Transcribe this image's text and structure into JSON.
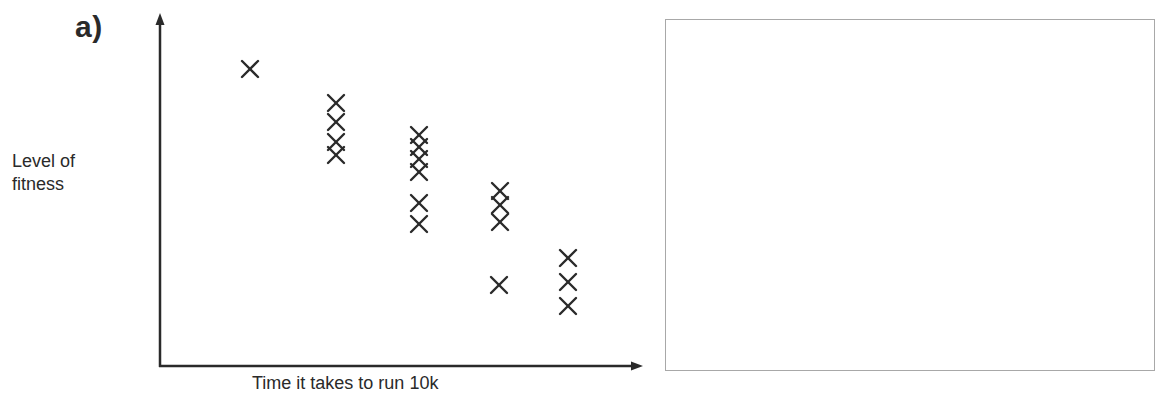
{
  "panel": {
    "label": "a)"
  },
  "chart_data": {
    "type": "scatter",
    "title": "",
    "xlabel": "Time it takes to run 10k",
    "ylabel": "Level of fitness",
    "ylabel_lines": [
      "Level of",
      "fitness"
    ],
    "grid": false,
    "legend": null,
    "marker": "x",
    "axes": {
      "x_ticks": [],
      "y_ticks": [],
      "arrows": true
    },
    "x_units": "relative position (0-100, left to right)",
    "y_units": "relative level (0-100, bottom to top)",
    "points": [
      {
        "x": 19,
        "y": 84
      },
      {
        "x": 36,
        "y": 75
      },
      {
        "x": 36,
        "y": 69
      },
      {
        "x": 36,
        "y": 64
      },
      {
        "x": 36,
        "y": 60
      },
      {
        "x": 53,
        "y": 66
      },
      {
        "x": 53,
        "y": 63
      },
      {
        "x": 53,
        "y": 59
      },
      {
        "x": 53,
        "y": 56
      },
      {
        "x": 53,
        "y": 47
      },
      {
        "x": 53,
        "y": 41
      },
      {
        "x": 70,
        "y": 50
      },
      {
        "x": 70,
        "y": 46
      },
      {
        "x": 70,
        "y": 41
      },
      {
        "x": 70,
        "y": 23
      },
      {
        "x": 84,
        "y": 31
      },
      {
        "x": 84,
        "y": 24
      },
      {
        "x": 84,
        "y": 17
      }
    ],
    "pixel_points": [
      [
        250,
        69
      ],
      [
        336,
        103
      ],
      [
        336,
        122
      ],
      [
        336,
        142
      ],
      [
        336,
        155
      ],
      [
        419,
        135
      ],
      [
        419,
        147
      ],
      [
        419,
        159
      ],
      [
        419,
        172
      ],
      [
        419,
        203
      ],
      [
        419,
        224
      ],
      [
        500,
        191
      ],
      [
        500,
        205
      ],
      [
        500,
        222
      ],
      [
        499,
        285
      ],
      [
        568,
        258
      ],
      [
        568,
        282
      ],
      [
        568,
        306
      ]
    ],
    "trend": "negative correlation: longer 10k time, lower fitness"
  },
  "answer_box": {
    "content": ""
  },
  "colors": {
    "ink": "#2a2a2a",
    "box_border": "#a8a8a8",
    "background": "#ffffff"
  }
}
